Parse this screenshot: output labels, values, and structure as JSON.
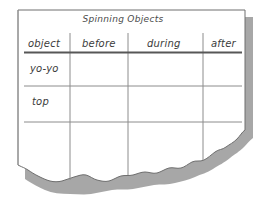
{
  "document": {
    "medium": "torn-paper-sheet",
    "title": "Spinning Objects"
  },
  "table": {
    "headers": [
      "object",
      "before",
      "during",
      "after"
    ],
    "rows": [
      {
        "label": "yo-yo",
        "before": "",
        "during": "",
        "after": ""
      },
      {
        "label": "top",
        "before": "",
        "during": "",
        "after": ""
      }
    ]
  },
  "colors": {
    "paper": "#ffffff",
    "paper_edge": "#8a8a8a",
    "shadow": "#5a5a5a",
    "rule_line": "#8c8c8c",
    "header_rule": "#575757",
    "ink": "#3b3b3b",
    "background": "#ffffff"
  }
}
